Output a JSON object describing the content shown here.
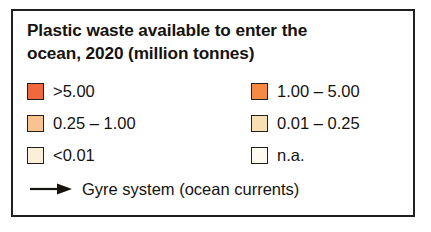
{
  "legend": {
    "title": "Plastic waste available to enter the\nocean, 2020 (million tonnes)",
    "title_line_1": "Plastic waste available to enter the",
    "title_line_2": "ocean, 2020 (million tonnes)",
    "border_color": "#231f20",
    "background_color": "#ffffff",
    "text_color": "#16130f",
    "rows": [
      {
        "left": {
          "label": ">5.00",
          "color": "#f0683c",
          "swatch_name": "swatch-gt-5"
        },
        "right": {
          "label": "1.00 – 5.00",
          "color": "#f58a42",
          "swatch_name": "swatch-1-to-5"
        }
      },
      {
        "left": {
          "label": "0.25 – 1.00",
          "color": "#f9c291",
          "swatch_name": "swatch-025-to-1"
        },
        "right": {
          "label": "0.01 – 0.25",
          "color": "#f6e0b3",
          "swatch_name": "swatch-001-to-025"
        }
      },
      {
        "left": {
          "label": "<0.01",
          "color": "#faf0d9",
          "swatch_name": "swatch-lt-001"
        },
        "right": {
          "label": "n.a.",
          "color": "#fcfaf1",
          "swatch_name": "swatch-na"
        }
      }
    ],
    "gyre": {
      "label": "Gyre system (ocean currents)",
      "icon": "arrow-right-icon",
      "arrow_color": "#16130f"
    }
  }
}
